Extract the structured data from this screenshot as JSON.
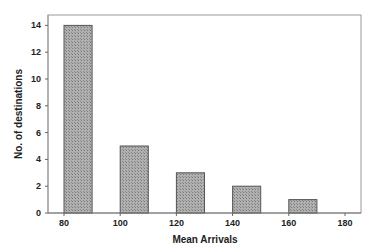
{
  "chart_data": {
    "type": "bar",
    "title": "",
    "xlabel": "Mean Arrivals",
    "ylabel": "No. of destinations",
    "categories": [
      "80-90",
      "100-110",
      "120-130",
      "140-150",
      "160-170"
    ],
    "bin_starts": [
      80,
      100,
      120,
      140,
      160
    ],
    "bin_width": 10,
    "values": [
      14,
      5,
      3,
      2,
      1
    ],
    "xlim": [
      75,
      185
    ],
    "ylim": [
      0,
      14.5
    ],
    "xticks": [
      80,
      100,
      120,
      140,
      160,
      180
    ],
    "yticks": [
      0,
      2,
      4,
      6,
      8,
      10,
      12,
      14
    ],
    "grid": false,
    "legend": null,
    "bar_fill": "#9e9e9e",
    "bar_pattern": "crosshatch"
  },
  "labels": {
    "xlabel": "Mean Arrivals",
    "ylabel": "No. of destinations",
    "xticks": [
      "80",
      "100",
      "120",
      "140",
      "160",
      "180"
    ],
    "yticks": [
      "0",
      "2",
      "4",
      "6",
      "8",
      "10",
      "12",
      "14"
    ]
  }
}
